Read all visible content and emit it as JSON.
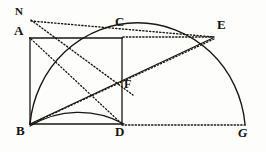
{
  "figure": {
    "stroke_color": "#1a1713",
    "background_color": "#fdfdfb",
    "points": {
      "N": {
        "label": "N",
        "x": 30,
        "y": 20
      },
      "A": {
        "label": "A",
        "x": 30,
        "y": 38
      },
      "C": {
        "label": "C",
        "x": 122,
        "y": 38
      },
      "E": {
        "label": "E",
        "x": 212,
        "y": 38
      },
      "F": {
        "label": "F",
        "x": 122,
        "y": 84
      },
      "B": {
        "label": "B",
        "x": 30,
        "y": 124
      },
      "D": {
        "label": "D",
        "x": 122,
        "y": 124
      },
      "G": {
        "label": "G",
        "x": 245,
        "y": 124
      }
    },
    "solid_segments": [
      {
        "name": "segment-A-C",
        "x1": 30,
        "y1": 38,
        "x2": 122,
        "y2": 38
      },
      {
        "name": "segment-A-B",
        "x1": 30,
        "y1": 38,
        "x2": 30,
        "y2": 124
      },
      {
        "name": "segment-B-D",
        "x1": 30,
        "y1": 124,
        "x2": 122,
        "y2": 124
      },
      {
        "name": "segment-C-D",
        "x1": 122,
        "y1": 38,
        "x2": 122,
        "y2": 124
      },
      {
        "name": "segment-B-E",
        "x1": 30,
        "y1": 124,
        "x2": 212,
        "y2": 38
      }
    ],
    "dotted_segments": [
      {
        "name": "dotted-C-E",
        "x1": 122,
        "y1": 38,
        "x2": 214,
        "y2": 38
      },
      {
        "name": "dotted-D-G",
        "x1": 122,
        "y1": 124,
        "x2": 245,
        "y2": 124
      },
      {
        "name": "dotted-N-D",
        "x1": 30,
        "y1": 20,
        "x2": 130,
        "y2": 92
      },
      {
        "name": "dotted-N-E",
        "x1": 30,
        "y1": 20,
        "x2": 214,
        "y2": 37
      },
      {
        "name": "dotted-B-E-upper",
        "x1": 30,
        "y1": 124,
        "x2": 214,
        "y2": 38
      },
      {
        "name": "dotted-A-D-diagonal",
        "x1": 30,
        "y1": 38,
        "x2": 122,
        "y2": 124
      }
    ],
    "arcs": [
      {
        "name": "quarter-arc-B-to-C",
        "type": "quarter-circle",
        "center_x": 30,
        "center_y": 124,
        "radius": 92,
        "start_x": 30,
        "start_y": 32,
        "end_x": 122,
        "end_y": 124
      },
      {
        "name": "semicircle-B-to-G",
        "type": "semicircle",
        "center_x": 137,
        "center_y": 124,
        "radius": 108,
        "start_x": 30,
        "start_y": 124,
        "end_x": 245,
        "end_y": 124,
        "apex_x": 137,
        "apex_y": 12
      }
    ]
  }
}
